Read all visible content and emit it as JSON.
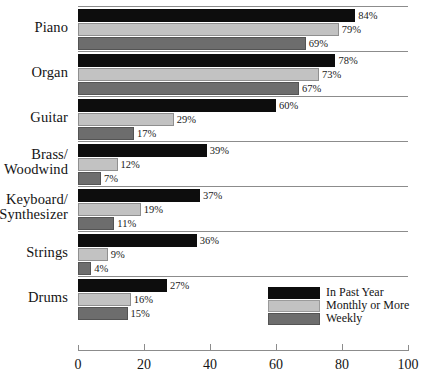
{
  "chart_data": {
    "type": "bar",
    "orientation": "horizontal",
    "title": "",
    "xlabel": "",
    "ylabel": "",
    "xlim": [
      0,
      100
    ],
    "xticks": [
      0,
      20,
      40,
      60,
      80,
      100
    ],
    "grid": false,
    "legend_position": "bottom-right",
    "value_label_suffix": "%",
    "categories": [
      "Piano",
      "Organ",
      "Guitar",
      "Brass/ Woodwind",
      "Keyboard/ Synthesizer",
      "Strings",
      "Drums"
    ],
    "series": [
      {
        "name": "In Past Year",
        "color": "#0d0d0d",
        "values": [
          84,
          78,
          60,
          39,
          37,
          36,
          27
        ],
        "labels": [
          "84%",
          "78%",
          "60%",
          "39%",
          "37%",
          "36%",
          "27%"
        ]
      },
      {
        "name": "Monthly or More",
        "color": "#c2c2c2",
        "values": [
          79,
          73,
          29,
          12,
          19,
          9,
          16
        ],
        "labels": [
          "79%",
          "73%",
          "29%",
          "12%",
          "19%",
          "9%",
          "16%"
        ]
      },
      {
        "name": "Weekly",
        "color": "#6d6d6d",
        "values": [
          69,
          67,
          17,
          7,
          11,
          4,
          15
        ],
        "labels": [
          "69%",
          "67%",
          "17%",
          "7%",
          "11%",
          "4%",
          "15%"
        ]
      }
    ]
  },
  "categories_display": [
    {
      "lines": [
        "Piano"
      ]
    },
    {
      "lines": [
        "Organ"
      ]
    },
    {
      "lines": [
        "Guitar"
      ]
    },
    {
      "lines": [
        "Brass/",
        "Woodwind"
      ]
    },
    {
      "lines": [
        "Keyboard/",
        "Synthesizer"
      ]
    },
    {
      "lines": [
        "Strings"
      ]
    },
    {
      "lines": [
        "Drums"
      ]
    }
  ],
  "axis": {
    "tick_labels": [
      "0",
      "20",
      "40",
      "60",
      "80",
      "100"
    ]
  },
  "legend": {
    "items": [
      {
        "label": "In Past Year",
        "color": "#0d0d0d"
      },
      {
        "label": "Monthly or More",
        "color": "#c2c2c2"
      },
      {
        "label": "Weekly",
        "color": "#6d6d6d"
      }
    ]
  }
}
